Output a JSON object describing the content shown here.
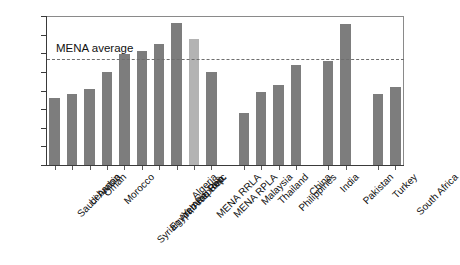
{
  "chart_data": {
    "type": "bar",
    "title": "",
    "subtitle": "",
    "xlabel": "",
    "ylabel": "",
    "ylim": [
      0,
      8
    ],
    "ytick_labels": [
      "0",
      "1",
      "2",
      "3",
      "4",
      "5",
      "6",
      "7",
      "8"
    ],
    "ytick_values": [
      0,
      1,
      2,
      3,
      4,
      5,
      6,
      7,
      8
    ],
    "grid": false,
    "legend": "none",
    "categories": [
      "Saudi Arabia",
      "Lebanon",
      "Oman",
      "Morocco",
      "Syrian Arab Republic",
      "Egypt, Arab Rep.",
      "Yemen, Rep.",
      "Algeria",
      "MENA RRLA",
      "MENA RPLA",
      "Malaysia",
      "Thailand",
      "Philippines",
      "China",
      "India",
      "Pakistan",
      "Turkey",
      "South Africa"
    ],
    "values": [
      3.6,
      3.8,
      4.1,
      5.0,
      5.95,
      6.1,
      6.5,
      7.6,
      6.75,
      5.0,
      2.8,
      3.9,
      4.3,
      5.35,
      5.6,
      7.55,
      3.8,
      4.2
    ],
    "bar_colors": [
      "#7d7d7d",
      "#7d7d7d",
      "#7d7d7d",
      "#7d7d7d",
      "#7d7d7d",
      "#7d7d7d",
      "#7d7d7d",
      "#7d7d7d",
      "#b3b3b3",
      "#7d7d7d",
      "#7d7d7d",
      "#7d7d7d",
      "#7d7d7d",
      "#7d7d7d",
      "#7d7d7d",
      "#7d7d7d",
      "#7d7d7d",
      "#7d7d7d"
    ],
    "group_breaks_after": [
      9,
      13,
      15
    ],
    "annotations": [
      {
        "name": "mena-average",
        "label": "MENA average",
        "value": 5.68,
        "style": "dashed-horizontal-line"
      }
    ],
    "colors": {
      "bar_primary": "#7d7d7d",
      "bar_highlight": "#b3b3b3",
      "axis": "#3a3a3a",
      "frame": "#8a8a8a",
      "avg_line": "#6e6e6e",
      "text": "#111111",
      "background": "#ffffff"
    }
  }
}
